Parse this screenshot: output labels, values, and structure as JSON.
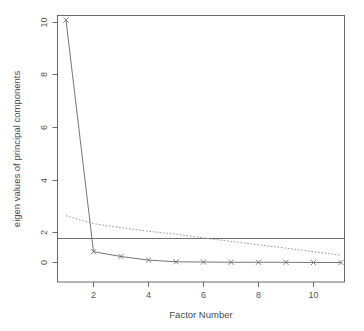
{
  "chart_data": {
    "type": "line",
    "title": "",
    "xlabel": "Factor Number",
    "ylabel": "eigen values of principal components",
    "x": [
      1,
      2,
      3,
      4,
      5,
      6,
      7,
      8,
      9,
      10,
      11
    ],
    "xlim": [
      1,
      11
    ],
    "ylim": [
      -0.3,
      10.3
    ],
    "grid": false,
    "legend": "none",
    "xticks": [
      2,
      4,
      6,
      8,
      10
    ],
    "xtick_labels": [
      "2",
      "4",
      "6",
      "8",
      "10"
    ],
    "yticks": [
      0,
      2,
      4,
      6,
      8,
      10
    ],
    "ytick_labels": [
      "0",
      "2",
      "4",
      "6",
      "8",
      "10"
    ],
    "series": [
      {
        "name": "PC Actual Data",
        "style": "solid",
        "marker": "x",
        "values": [
          10.1,
          0.45,
          0.25,
          0.1,
          0.03,
          0.02,
          0.01,
          0.01,
          0.01,
          0.0,
          0.0
        ]
      },
      {
        "name": "PC Simulated Data",
        "style": "dotted",
        "marker": "none",
        "values": [
          1.95,
          1.62,
          1.45,
          1.3,
          1.18,
          1.02,
          0.88,
          0.74,
          0.6,
          0.45,
          0.3
        ]
      }
    ],
    "reference_lines": [
      {
        "name": "eigenvalue-one-criterion",
        "orientation": "horizontal",
        "value": 1.0,
        "style": "solid"
      }
    ]
  },
  "colors": {
    "background": "#ffffff",
    "frame": "#5a5a5a",
    "solid_series": "#666666",
    "dotted_series": "#8a8a8a",
    "reference_line": "#606060",
    "text": "#4d4d4d"
  }
}
